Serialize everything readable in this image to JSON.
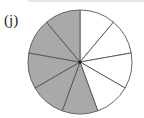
{
  "label": "(j)",
  "diagram": {
    "type": "fraction-circle",
    "total_sectors": 9,
    "shaded_sectors": 5,
    "unshaded_sectors": 4,
    "fraction_shaded": "5/9",
    "colors": {
      "shaded": "#a9a9a9",
      "unshaded": "#ffffff",
      "stroke": "#555555"
    },
    "center": [
      80,
      62
    ],
    "radius": 52
  }
}
